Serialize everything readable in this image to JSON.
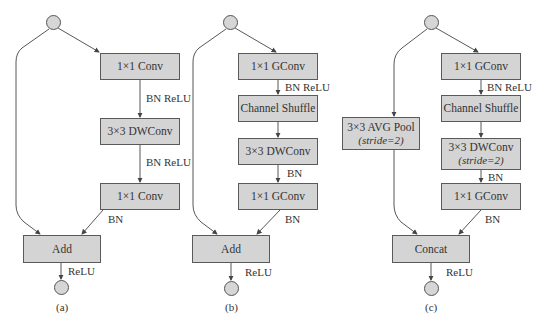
{
  "diagrams": [
    {
      "caption": "(a)",
      "boxes": {
        "conv1": "1×1 Conv",
        "dwconv": "3×3 DWConv",
        "conv2": "1×1 Conv",
        "merge": "Add"
      },
      "edge_labels": {
        "after_conv1": "BN ReLU",
        "after_dwconv": "BN ReLU",
        "after_conv2": "BN",
        "after_merge": "ReLU"
      }
    },
    {
      "caption": "(b)",
      "boxes": {
        "gconv1": "1×1 GConv",
        "shuffle": "Channel Shuffle",
        "dwconv": "3×3 DWConv",
        "gconv2": "1×1 GConv",
        "merge": "Add"
      },
      "edge_labels": {
        "after_gconv1": "BN ReLU",
        "after_dwconv": "BN",
        "after_gconv2": "BN",
        "after_merge": "ReLU"
      }
    },
    {
      "caption": "(c)",
      "boxes": {
        "avgpool": "3×3 AVG Pool",
        "avgpool_sub": "(stride=2)",
        "gconv1": "1×1 GConv",
        "shuffle": "Channel Shuffle",
        "dwconv": "3×3 DWConv",
        "dwconv_sub": "(stride=2)",
        "gconv2": "1×1 GConv",
        "merge": "Concat"
      },
      "edge_labels": {
        "after_gconv1": "BN ReLU",
        "after_dwconv": "BN",
        "after_gconv2": "BN",
        "after_merge": "ReLU"
      }
    }
  ],
  "colors": {
    "box_fill": "#d4d4d4",
    "box_border": "#5a5a5a",
    "line": "#444444"
  }
}
